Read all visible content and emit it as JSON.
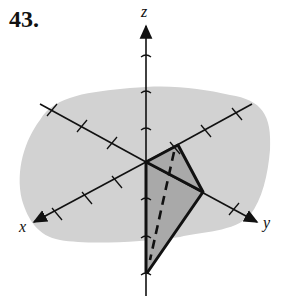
{
  "problem_number": "43.",
  "axes": {
    "x_label": "x",
    "y_label": "y",
    "z_label": "z"
  },
  "colors": {
    "plane_fill": "#d2d2d2",
    "triangle_fill": "#a8a8a8",
    "line": "#111111"
  },
  "figure": {
    "triangle_vertices_px": [
      [
        178,
        145
      ],
      [
        203,
        192
      ],
      [
        147,
        273
      ]
    ]
  }
}
